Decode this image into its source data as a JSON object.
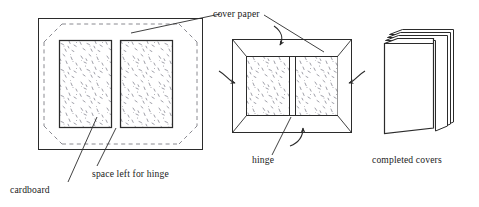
{
  "figure": {
    "line_color": "#2b2b2b",
    "speckle_color": "#8c8c96",
    "dash_color": "#7d7d85",
    "paper_fill": "#ffffff",
    "board_fill": "#fdfdfd",
    "text_color": "#1a1a1a"
  },
  "labels": {
    "cover_paper": "cover paper",
    "cardboard": "cardboard",
    "space_left_for_hinge": "space left for hinge",
    "hinge": "hinge",
    "completed_covers": "completed covers"
  },
  "panels": [
    {
      "id": "panel-flat-layout",
      "name": "flat cover paper with cardboard boards",
      "annotations": [
        "cover paper",
        "cardboard",
        "space left for hinge"
      ]
    },
    {
      "id": "panel-folded-flaps",
      "name": "cover paper edges folded over boards",
      "annotations": [
        "cover paper",
        "hinge"
      ],
      "fold_arrows": [
        "top",
        "left",
        "right",
        "bottom"
      ]
    },
    {
      "id": "panel-completed-covers",
      "name": "stack of finished covers",
      "annotations": [
        "completed covers"
      ]
    }
  ]
}
